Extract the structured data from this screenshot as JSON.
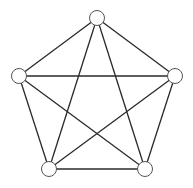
{
  "diagram": {
    "colors": {
      "edge": "#2a2a2a",
      "node_stroke": "#555555",
      "node_fill": "#ffffff",
      "background": "#ffffff"
    },
    "node_radius": 7.5,
    "nodes": [
      {
        "id": "top",
        "x": 97,
        "y": 18
      },
      {
        "id": "left",
        "x": 19,
        "y": 76
      },
      {
        "id": "right",
        "x": 175,
        "y": 76
      },
      {
        "id": "bottom-left",
        "x": 49,
        "y": 169
      },
      {
        "id": "bottom-right",
        "x": 145,
        "y": 169
      }
    ],
    "edges": [
      [
        "top",
        "left"
      ],
      [
        "top",
        "right"
      ],
      [
        "top",
        "bottom-left"
      ],
      [
        "top",
        "bottom-right"
      ],
      [
        "left",
        "right"
      ],
      [
        "left",
        "bottom-left"
      ],
      [
        "left",
        "bottom-right"
      ],
      [
        "right",
        "bottom-left"
      ],
      [
        "right",
        "bottom-right"
      ],
      [
        "bottom-left",
        "bottom-right"
      ]
    ]
  }
}
